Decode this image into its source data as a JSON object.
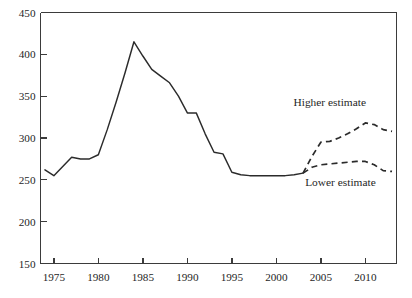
{
  "chart_data": {
    "type": "line",
    "title": "",
    "subtitle": "",
    "xlabel": "",
    "ylabel": "",
    "xlim": [
      1973.5,
      2013.5
    ],
    "ylim": [
      150,
      450
    ],
    "grid": false,
    "legend_position": "inline-annotations",
    "x_ticks": [
      1975,
      1980,
      1985,
      1990,
      1995,
      2000,
      2005,
      2010
    ],
    "x_tick_labels": [
      "1975",
      "1980",
      "1985",
      "1990",
      "1995",
      "2000",
      "2005",
      "2010"
    ],
    "y_ticks": [
      150,
      200,
      250,
      300,
      350,
      400,
      450
    ],
    "y_tick_labels": [
      "150",
      "200",
      "250",
      "300",
      "350",
      "400",
      "450"
    ],
    "annotations": [
      {
        "text": "Higher estimate",
        "x": 2006.0,
        "y": 338
      },
      {
        "text": "Lower estimate",
        "x": 2007.2,
        "y": 243
      }
    ],
    "series": [
      {
        "name": "Historical",
        "style": "solid",
        "color": "#2b2b2b",
        "x": [
          1974,
          1975,
          1976,
          1977,
          1978,
          1979,
          1980,
          1981,
          1982,
          1983,
          1984,
          1985,
          1986,
          1987,
          1988,
          1989,
          1990,
          1991,
          1992,
          1993,
          1994,
          1995,
          1996,
          1997,
          1998,
          1999,
          2000,
          2001,
          2002,
          2003
        ],
        "values": [
          262,
          255,
          266,
          277,
          275,
          275,
          280,
          310,
          343,
          378,
          415,
          398,
          382,
          374,
          366,
          350,
          330,
          330,
          305,
          283,
          281,
          259,
          256,
          255,
          255,
          255,
          255,
          255,
          256,
          258
        ]
      },
      {
        "name": "Higher estimate",
        "style": "dashed",
        "color": "#2b2b2b",
        "x": [
          2003,
          2004,
          2005,
          2006,
          2007,
          2008,
          2009,
          2010,
          2011,
          2012,
          2013
        ],
        "values": [
          258,
          278,
          295,
          296,
          300,
          305,
          311,
          318,
          316,
          310,
          308
        ]
      },
      {
        "name": "Lower estimate",
        "style": "dashed",
        "color": "#2b2b2b",
        "x": [
          2003,
          2004,
          2005,
          2006,
          2007,
          2008,
          2009,
          2010,
          2011,
          2012,
          2013
        ],
        "values": [
          258,
          265,
          268,
          269,
          270,
          271,
          272,
          272,
          268,
          261,
          260
        ]
      }
    ]
  }
}
